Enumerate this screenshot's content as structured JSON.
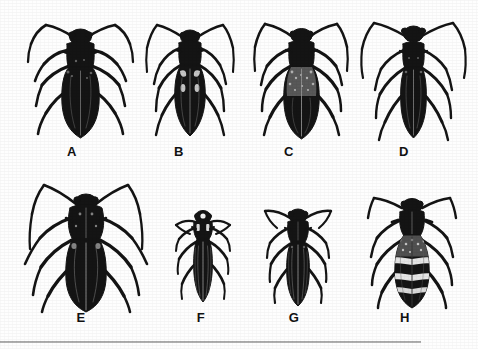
{
  "plate": {
    "background_color": "#fefefe",
    "ink_color": "#111111",
    "width": 478,
    "height": 349,
    "rule": {
      "name": "bottom-horizontal-rule",
      "x": 0,
      "y": 341,
      "width": 421,
      "height": 2,
      "color": "#a8a8a8"
    }
  },
  "specimens": [
    {
      "id": "a",
      "label": "A",
      "common_name": "longhorn-beetle-specimen-a",
      "row": 1,
      "column": 1,
      "body_x": 20,
      "body_y": 16,
      "body_width": 120,
      "body_height": 128,
      "label_x": 57,
      "label_y": 145,
      "elytra_pattern": "solid-black",
      "antenna_length": "long-swept",
      "size_class": "large",
      "ink_color": "#141414"
    },
    {
      "id": "b",
      "label": "B",
      "common_name": "longhorn-beetle-specimen-b",
      "row": 1,
      "column": 2,
      "body_x": 140,
      "body_y": 18,
      "body_width": 96,
      "body_height": 124,
      "label_x": 164,
      "label_y": 145,
      "elytra_pattern": "solid-black-pale-shoulder-flecks",
      "antenna_length": "long-swept",
      "size_class": "medium",
      "ink_color": "#141414"
    },
    {
      "id": "c",
      "label": "C",
      "common_name": "longhorn-beetle-specimen-c",
      "row": 1,
      "column": 3,
      "body_x": 246,
      "body_y": 16,
      "body_width": 108,
      "body_height": 128,
      "label_x": 274,
      "label_y": 145,
      "elytra_pattern": "grey-mottled-shoulders",
      "antenna_length": "long-swept",
      "size_class": "large",
      "ink_color": "#141414"
    },
    {
      "id": "d",
      "label": "D",
      "common_name": "longhorn-beetle-specimen-d",
      "row": 1,
      "column": 4,
      "body_x": 356,
      "body_y": 14,
      "body_width": 112,
      "body_height": 132,
      "label_x": 389,
      "label_y": 145,
      "elytra_pattern": "solid-black-narrow",
      "antenna_length": "very-long-arched",
      "size_class": "large",
      "ink_color": "#141414"
    },
    {
      "id": "e",
      "label": "E",
      "common_name": "longhorn-beetle-specimen-e",
      "row": 2,
      "column": 1,
      "body_x": 14,
      "body_y": 176,
      "body_width": 140,
      "body_height": 136,
      "label_x": 66,
      "label_y": 311,
      "elytra_pattern": "solid-black-broad-thorax",
      "antenna_length": "very-long-arched",
      "size_class": "large",
      "ink_color": "#141414"
    },
    {
      "id": "f",
      "label": "F",
      "common_name": "longhorn-beetle-specimen-f",
      "row": 2,
      "column": 2,
      "body_x": 168,
      "body_y": 206,
      "body_width": 66,
      "body_height": 100,
      "label_x": 186,
      "label_y": 311,
      "elytra_pattern": "striated-black",
      "antenna_length": "short-spread",
      "size_class": "small",
      "ink_color": "#141414"
    },
    {
      "id": "g",
      "label": "G",
      "common_name": "longhorn-beetle-specimen-g",
      "row": 2,
      "column": 3,
      "body_x": 258,
      "body_y": 202,
      "body_width": 76,
      "body_height": 106,
      "label_x": 279,
      "label_y": 311,
      "elytra_pattern": "striated-black",
      "antenna_length": "medium-curved",
      "size_class": "small-medium",
      "ink_color": "#141414"
    },
    {
      "id": "h",
      "label": "H",
      "common_name": "banded-longhorn-beetle-specimen-h",
      "row": 2,
      "column": 4,
      "body_x": 354,
      "body_y": 190,
      "body_width": 112,
      "body_height": 120,
      "label_x": 390,
      "label_y": 311,
      "elytra_pattern": "white-transverse-bands",
      "antenna_length": "medium-arched",
      "size_class": "medium-large",
      "ink_color": "#141414"
    }
  ]
}
